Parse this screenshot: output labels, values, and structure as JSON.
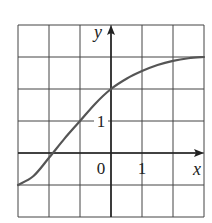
{
  "chart_data": {
    "type": "line",
    "title": "",
    "xlabel": "x",
    "ylabel": "y",
    "xlim": [
      -3,
      3
    ],
    "ylim": [
      -2,
      4
    ],
    "grid": true,
    "grid_step": 1,
    "tick_labels": {
      "origin": "0",
      "x": [
        {
          "value": 1,
          "label": "1"
        }
      ],
      "y": [
        {
          "value": 1,
          "label": "1"
        }
      ]
    },
    "series": [
      {
        "name": "curve",
        "color": "#555555",
        "x": [
          -3,
          -2.5,
          -2,
          -1.5,
          -1,
          -0.5,
          0,
          0.5,
          1,
          1.5,
          2,
          2.5,
          3
        ],
        "y": [
          -1,
          -0.72,
          -0.15,
          0.45,
          1,
          1.55,
          2,
          2.32,
          2.56,
          2.75,
          2.88,
          2.96,
          3
        ]
      }
    ]
  },
  "labels": {
    "x_axis": "x",
    "y_axis": "y",
    "origin": "0",
    "x_tick_1": "1",
    "y_tick_1": "1"
  },
  "colors": {
    "grid": "#444444",
    "axis": "#222222",
    "curve": "#555555",
    "background": "#ffffff"
  }
}
